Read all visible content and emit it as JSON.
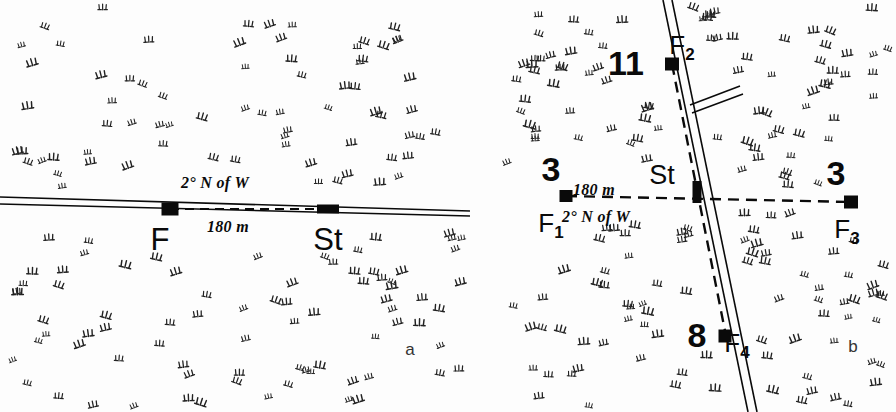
{
  "figure": {
    "type": "field-site-map",
    "panels": [
      {
        "id": "a",
        "letter": "a",
        "letter_pos": {
          "x": 410,
          "y": 341
        },
        "description": "Single feeder and station along an east-west road",
        "road": {
          "kind": "double-line-road",
          "orientation": "east-west",
          "x1": 0,
          "y1": 197,
          "x2": 470,
          "y2": 211
        },
        "bearing_label": {
          "text": "2° N of W",
          "x": 215,
          "y": 175
        },
        "distance_label": {
          "text": "180 m",
          "x": 228,
          "y": 219
        },
        "transect": {
          "x1": 170,
          "y1": 209,
          "x2": 330,
          "y2": 209,
          "style": "dashed"
        },
        "markers": [
          {
            "name": "F",
            "label": "F",
            "shape": "square",
            "x": 170,
            "y": 209,
            "w": 17,
            "h": 13,
            "label_pos": {
              "x": 160,
              "y": 224
            }
          },
          {
            "name": "St",
            "label": "St",
            "shape": "bar",
            "x": 328,
            "y": 209,
            "w": 22,
            "h": 9,
            "label_pos": {
              "x": 328,
              "y": 224
            }
          }
        ]
      },
      {
        "id": "b",
        "letter": "b",
        "letter_pos": {
          "x": 853,
          "y": 338
        },
        "description": "Four feeders around a station at a road junction",
        "road": {
          "kind": "double-line-road",
          "orientation": "north-south",
          "x1": 663,
          "y1": 0,
          "x2": 748,
          "y2": 412,
          "branch": {
            "x1": 690,
            "y1": 105,
            "x2": 740,
            "y2": 86
          }
        },
        "bearing_label": {
          "text": "2° N of W",
          "x": 596,
          "y": 209
        },
        "distance_label": {
          "text": "180 m",
          "x": 594,
          "y": 182
        },
        "transect_ew": {
          "x1": 566,
          "y1": 196,
          "x2": 851,
          "y2": 202,
          "style": "dashed"
        },
        "transect_ns": {
          "x1": 672,
          "y1": 64,
          "x2": 726,
          "y2": 336,
          "style": "dashed"
        },
        "markers": [
          {
            "name": "F1",
            "label": "F",
            "sub": "1",
            "count": "3",
            "shape": "square",
            "x": 566,
            "y": 196,
            "w": 13,
            "h": 12,
            "count_pos": {
              "x": 551,
              "y": 152
            },
            "label_pos": {
              "x": 551,
              "y": 210
            }
          },
          {
            "name": "F2",
            "label": "F",
            "sub": "2",
            "count": "11",
            "shape": "square",
            "x": 672,
            "y": 64,
            "w": 14,
            "h": 13,
            "count_pos": {
              "x": 626,
              "y": 46
            },
            "label_pos": {
              "x": 682,
              "y": 32
            }
          },
          {
            "name": "F3",
            "label": "F",
            "sub": "3",
            "count": "3",
            "shape": "square",
            "x": 851,
            "y": 202,
            "w": 14,
            "h": 13,
            "count_pos": {
              "x": 836,
              "y": 156
            },
            "label_pos": {
              "x": 847,
              "y": 216
            }
          },
          {
            "name": "F4",
            "label": "F",
            "sub": "4",
            "count": "8",
            "shape": "square",
            "x": 725,
            "y": 336,
            "w": 13,
            "h": 13,
            "count_pos": {
              "x": 697,
              "y": 318
            },
            "label_pos": {
              "x": 737,
              "y": 330
            }
          },
          {
            "name": "St",
            "label": "St",
            "shape": "vertical-bar",
            "x": 697,
            "y": 192,
            "w": 9,
            "h": 22,
            "label_pos": {
              "x": 662,
              "y": 162
            }
          }
        ]
      }
    ],
    "legend_note": "stippling represents marsh / grass-tuft vegetation symbols",
    "colors": {
      "ink": "#0a0a0a",
      "background": "#fdfdfd",
      "vegetation": "#222222"
    }
  }
}
